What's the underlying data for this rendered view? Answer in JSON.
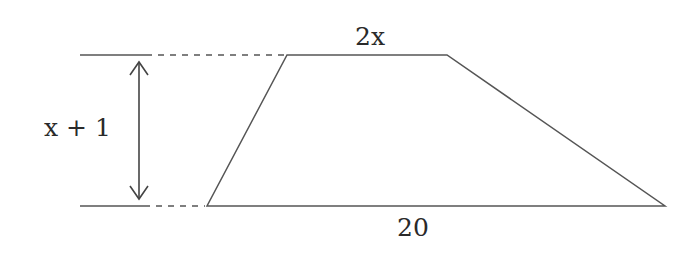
{
  "diagram": {
    "type": "trapezoid-geometry",
    "labels": {
      "top_base": "2x",
      "bottom_base": "20",
      "height": "x + 1"
    },
    "shape": {
      "top_left": [
        287,
        55
      ],
      "top_right": [
        447,
        55
      ],
      "bottom_right": [
        665,
        206
      ],
      "bottom_left": [
        207,
        206
      ]
    },
    "colors": {
      "stroke": "#555555",
      "text": "#2a2a2a",
      "background": "#ffffff"
    }
  }
}
